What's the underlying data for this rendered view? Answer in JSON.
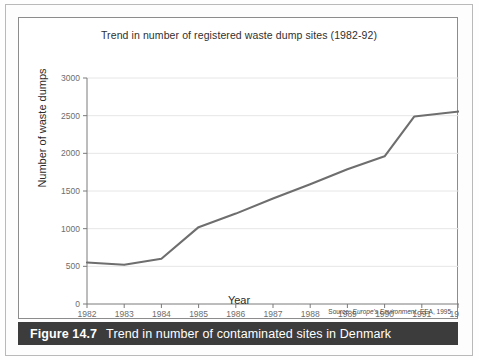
{
  "figure": {
    "number_label": "Figure 14.7",
    "caption": "Trend in number of contaminated sites in Denmark",
    "source_prefix": "Source: ",
    "source_italic": "Europe's Environment,",
    "source_suffix": " EEA, 1995"
  },
  "chart_data": {
    "type": "line",
    "title": "Trend in number of registered waste dump sites (1982-92)",
    "xlabel": "Year",
    "ylabel": "Number of waste dumps",
    "xlim": [
      1982,
      1992
    ],
    "ylim": [
      0,
      3000
    ],
    "xticks": [
      "1982",
      "1983",
      "1984",
      "1985",
      "1986",
      "1987",
      "1988",
      "1989",
      "1990",
      "1991",
      "1992"
    ],
    "yticks": [
      "0",
      "500",
      "1000",
      "1500",
      "2000",
      "2500",
      "3000"
    ],
    "grid": true,
    "legend": "none",
    "line_color": "#6e6e6e",
    "x": [
      1982,
      1983,
      1984,
      1985,
      1986,
      1987,
      1988,
      1989,
      1990,
      1990.8,
      1992
    ],
    "values": [
      550,
      520,
      600,
      1020,
      1200,
      1400,
      1590,
      1790,
      1960,
      2490,
      2555
    ],
    "series": [
      {
        "name": "Registered waste dump sites",
        "values": [
          550,
          520,
          600,
          1020,
          1200,
          1400,
          1590,
          1790,
          1960,
          2490,
          2555
        ]
      }
    ]
  }
}
